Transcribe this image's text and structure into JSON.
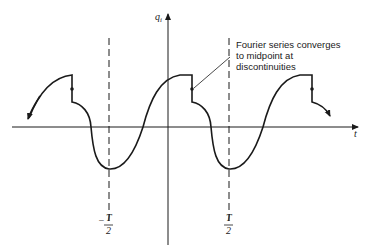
{
  "figure": {
    "y_axis_label": "q",
    "y_axis_subscript": "i",
    "x_axis_label": "t",
    "annotation": {
      "lines": [
        "Fourier series converges",
        "to midpoint at",
        "discontinuities"
      ]
    },
    "markers": [
      {
        "sign": "−",
        "numerator": "T",
        "denominator": "2"
      },
      {
        "sign": "",
        "numerator": "T",
        "denominator": "2"
      }
    ]
  },
  "colors": {
    "ink": "#1a1a1a",
    "background": "#ffffff"
  }
}
